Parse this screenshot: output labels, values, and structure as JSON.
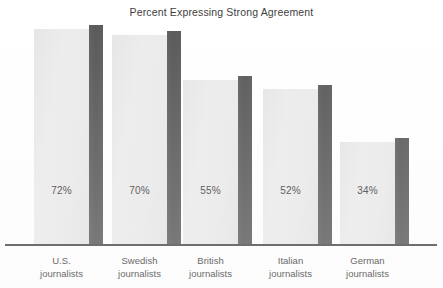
{
  "chart_data": {
    "type": "bar",
    "title": "Percent Expressing Strong Agreement",
    "xlabel": "",
    "ylabel": "",
    "ylim": [
      0,
      80
    ],
    "grid": false,
    "legend": null,
    "categories": [
      "U.S. journalists",
      "Swedish journalists",
      "British journalists",
      "Italian journalists",
      "German journalists"
    ],
    "category_lines": [
      [
        "U.S.",
        "journalists"
      ],
      [
        "Swedish",
        "journalists"
      ],
      [
        "British",
        "journalists"
      ],
      [
        "Italian",
        "journalists"
      ],
      [
        "German",
        "journalists"
      ]
    ],
    "values": [
      72,
      70,
      55,
      52,
      34
    ],
    "data_labels": [
      "72%",
      "70%",
      "55%",
      "52%",
      "34%"
    ],
    "colors": {
      "bar_face": "#eaeaea",
      "bar_side": "#585858",
      "axis": "#4a4a4a",
      "text": "#3d3d3d",
      "background": "#ffffff"
    }
  }
}
